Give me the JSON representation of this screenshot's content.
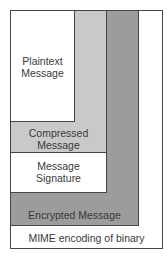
{
  "diagram": {
    "title": "",
    "layers": [
      {
        "id": "mime",
        "label": "MIME encoding of binary",
        "fill": "#ffffff"
      },
      {
        "id": "encrypted",
        "label": "Encrypted Message",
        "fill": "#9c9c9c"
      },
      {
        "id": "signature",
        "label_line1": "Message",
        "label_line2": "Signature",
        "fill": "#ffffff"
      },
      {
        "id": "compressed",
        "label_line1": "Compressed",
        "label_line2": "Message",
        "fill": "#c9c9c9"
      },
      {
        "id": "plaintext",
        "label_line1": "Plaintext",
        "label_line2": "Message",
        "fill": "#ffffff"
      }
    ]
  }
}
